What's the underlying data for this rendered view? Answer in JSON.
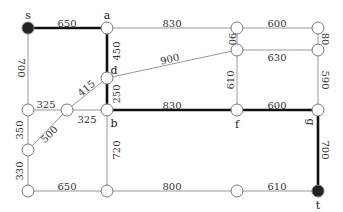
{
  "graph": {
    "nodes": [
      {
        "id": "s",
        "x": 28,
        "y": 28,
        "label": "s",
        "filled": true,
        "lx": 28,
        "ly": 16
      },
      {
        "id": "a",
        "x": 107,
        "y": 28,
        "label": "a",
        "filled": false,
        "lx": 107,
        "ly": 16
      },
      {
        "id": "n1",
        "x": 237,
        "y": 28,
        "label": "",
        "filled": false
      },
      {
        "id": "n2",
        "x": 318,
        "y": 28,
        "label": "",
        "filled": false
      },
      {
        "id": "n3",
        "x": 237,
        "y": 50,
        "label": "",
        "filled": false
      },
      {
        "id": "n4",
        "x": 318,
        "y": 50,
        "label": "",
        "filled": false
      },
      {
        "id": "d",
        "x": 107,
        "y": 78,
        "label": "d",
        "filled": false,
        "lx": 114,
        "ly": 71
      },
      {
        "id": "n5",
        "x": 28,
        "y": 110,
        "label": "",
        "filled": false
      },
      {
        "id": "n6",
        "x": 67,
        "y": 110,
        "label": "",
        "filled": false
      },
      {
        "id": "b",
        "x": 107,
        "y": 110,
        "label": "b",
        "filled": false,
        "lx": 114,
        "ly": 124
      },
      {
        "id": "f",
        "x": 237,
        "y": 110,
        "label": "f",
        "filled": false,
        "lx": 237,
        "ly": 125
      },
      {
        "id": "g",
        "x": 318,
        "y": 110,
        "label": "g",
        "filled": false,
        "lx": 310,
        "ly": 122,
        "rot": 90
      },
      {
        "id": "n7",
        "x": 28,
        "y": 150,
        "label": "",
        "filled": false
      },
      {
        "id": "n8",
        "x": 28,
        "y": 191,
        "label": "",
        "filled": false
      },
      {
        "id": "n9",
        "x": 107,
        "y": 191,
        "label": "",
        "filled": false
      },
      {
        "id": "n10",
        "x": 237,
        "y": 191,
        "label": "",
        "filled": false
      },
      {
        "id": "t",
        "x": 318,
        "y": 191,
        "label": "t",
        "filled": true,
        "lx": 318,
        "ly": 206
      }
    ],
    "edges": [
      {
        "from": "s",
        "to": "a",
        "w": "650",
        "bold": true,
        "tx": 67,
        "ty": 24,
        "rot": 0
      },
      {
        "from": "a",
        "to": "n1",
        "w": "830",
        "bold": false,
        "tx": 172,
        "ty": 24,
        "rot": 0
      },
      {
        "from": "n1",
        "to": "n2",
        "w": "600",
        "bold": false,
        "tx": 277,
        "ty": 24,
        "rot": 0
      },
      {
        "from": "n1",
        "to": "n3",
        "w": "90",
        "bold": false,
        "tx": 231,
        "ty": 39,
        "rot": 90
      },
      {
        "from": "n2",
        "to": "n4",
        "w": "80",
        "bold": false,
        "tx": 324,
        "ty": 39,
        "rot": 90
      },
      {
        "from": "n3",
        "to": "n4",
        "w": "630",
        "bold": false,
        "tx": 277,
        "ty": 58,
        "rot": 0
      },
      {
        "from": "a",
        "to": "d",
        "w": "450",
        "bold": true,
        "tx": 117,
        "ty": 51,
        "rot": -90
      },
      {
        "from": "d",
        "to": "n3",
        "w": "900",
        "bold": false,
        "tx": 170,
        "ty": 60,
        "rot": -14
      },
      {
        "from": "s",
        "to": "n5",
        "w": "700",
        "bold": false,
        "tx": 20,
        "ty": 68,
        "rot": 90
      },
      {
        "from": "d",
        "to": "b",
        "w": "250",
        "bold": true,
        "tx": 117,
        "ty": 94,
        "rot": -90
      },
      {
        "from": "n5",
        "to": "n6",
        "w": "325",
        "bold": false,
        "tx": 46,
        "ty": 105,
        "rot": 0
      },
      {
        "from": "n6",
        "to": "d",
        "w": "415",
        "bold": false,
        "tx": 87,
        "ty": 89,
        "rot": -40
      },
      {
        "from": "n6",
        "to": "b",
        "w": "325",
        "bold": false,
        "tx": 87,
        "ty": 120,
        "rot": 0
      },
      {
        "from": "b",
        "to": "f",
        "w": "830",
        "bold": true,
        "tx": 172,
        "ty": 106,
        "rot": 0
      },
      {
        "from": "f",
        "to": "n3",
        "w": "610",
        "bold": false,
        "tx": 231,
        "ty": 80,
        "rot": -90
      },
      {
        "from": "f",
        "to": "g",
        "w": "600",
        "bold": true,
        "tx": 277,
        "ty": 106,
        "rot": 0
      },
      {
        "from": "g",
        "to": "n4",
        "w": "590",
        "bold": false,
        "tx": 324,
        "ty": 80,
        "rot": 90
      },
      {
        "from": "n5",
        "to": "n7",
        "w": "350",
        "bold": false,
        "tx": 20,
        "ty": 130,
        "rot": -90
      },
      {
        "from": "n6",
        "to": "n7",
        "w": "500",
        "bold": false,
        "tx": 50,
        "ty": 135,
        "rot": -45
      },
      {
        "from": "n7",
        "to": "n8",
        "w": "330",
        "bold": false,
        "tx": 20,
        "ty": 171,
        "rot": -90
      },
      {
        "from": "b",
        "to": "n9",
        "w": "720",
        "bold": false,
        "tx": 117,
        "ty": 150,
        "rot": -90
      },
      {
        "from": "n8",
        "to": "n9",
        "w": "650",
        "bold": false,
        "tx": 67,
        "ty": 187,
        "rot": 0
      },
      {
        "from": "n9",
        "to": "n10",
        "w": "800",
        "bold": false,
        "tx": 172,
        "ty": 187,
        "rot": 0
      },
      {
        "from": "n10",
        "to": "t",
        "w": "610",
        "bold": false,
        "tx": 277,
        "ty": 187,
        "rot": 0
      },
      {
        "from": "g",
        "to": "t",
        "w": "700",
        "bold": true,
        "tx": 324,
        "ty": 150,
        "rot": 90
      }
    ]
  }
}
